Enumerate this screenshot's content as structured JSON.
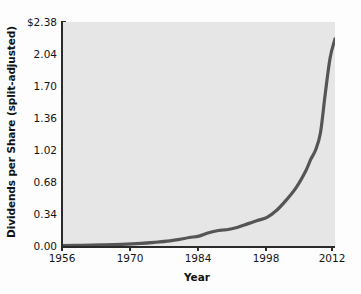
{
  "chart_data": {
    "type": "line",
    "title": "",
    "xlabel": "Year",
    "ylabel": "Dividends per Share (split-adjusted)",
    "xlim": [
      1956,
      2012
    ],
    "ylim": [
      0.0,
      2.38
    ],
    "grid": false,
    "legend": null,
    "line_color": "#555555",
    "plot_background": "#e6e6e6",
    "xticks": [
      1956,
      1970,
      1984,
      1998,
      2012
    ],
    "xtick_labels": [
      "1956",
      "1970",
      "1984",
      "1998",
      "2012"
    ],
    "yticks": [
      0.0,
      0.34,
      0.68,
      1.02,
      1.36,
      1.7,
      2.04,
      2.38
    ],
    "ytick_labels": [
      "0.00",
      "0.34",
      "0.68",
      "1.02",
      "1.36",
      "1.70",
      "2.04",
      "$2.38"
    ],
    "series": [
      {
        "name": "Dividends per Share",
        "x": [
          1956,
          1960,
          1964,
          1968,
          1972,
          1975,
          1978,
          1980,
          1982,
          1984,
          1986,
          1988,
          1989,
          1990,
          1992,
          1994,
          1996,
          1998,
          2000,
          2002,
          2004,
          2006,
          2007,
          2008,
          2009,
          2010,
          2011,
          2012
        ],
        "values": [
          0.005,
          0.008,
          0.012,
          0.018,
          0.028,
          0.04,
          0.055,
          0.07,
          0.09,
          0.105,
          0.14,
          0.165,
          0.17,
          0.175,
          0.2,
          0.235,
          0.27,
          0.305,
          0.38,
          0.49,
          0.62,
          0.8,
          0.92,
          1.02,
          1.2,
          1.62,
          2.0,
          2.2
        ]
      }
    ]
  }
}
